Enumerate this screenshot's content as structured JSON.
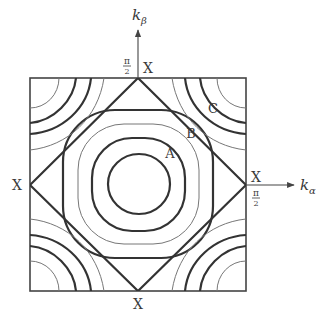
{
  "diagram": {
    "type": "brillouin-zone-contour-plot",
    "axes": {
      "vertical": {
        "label_main": "k",
        "label_sub": "β",
        "tick_label_num": "π",
        "tick_label_den": "2"
      },
      "horizontal": {
        "label_main": "k",
        "label_sub": "α",
        "tick_label_num": "π",
        "tick_label_den": "2"
      }
    },
    "points": {
      "top": "X",
      "right": "X",
      "left": "X",
      "bottom": "X"
    },
    "contour_labels": {
      "a": "A",
      "b": "B",
      "c": "C"
    },
    "colors": {
      "line_dark": "#333333",
      "line_light": "#777777",
      "background": "#ffffff"
    }
  }
}
